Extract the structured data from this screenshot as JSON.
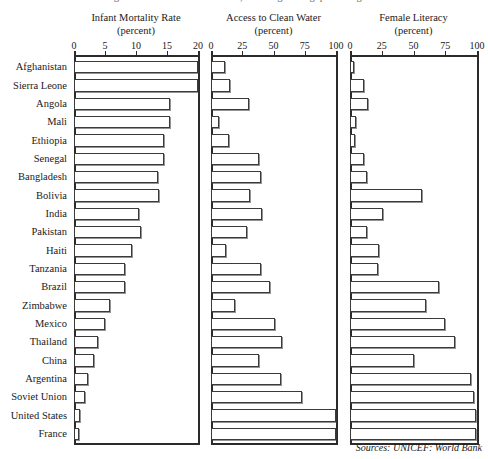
{
  "figure": {
    "top_cut_text": "a rough measure of social welfare, showing wide gaps among nations",
    "source_note": "Sources: UNICEF: World Bank"
  },
  "chart_data": {
    "type": "bar",
    "orientation": "horizontal",
    "title": "",
    "categories": [
      "Afghanistan",
      "Sierra Leone",
      "Angola",
      "Mali",
      "Ethiopia",
      "Senegal",
      "Bangladesh",
      "Bolivia",
      "India",
      "Pakistan",
      "Haiti",
      "Tanzania",
      "Brazil",
      "Zimbabwe",
      "Mexico",
      "Thailand",
      "China",
      "Argentina",
      "Soviet Union",
      "United States",
      "France"
    ],
    "panels": [
      {
        "title": "Infant Mortality Rate",
        "subtitle": "(percent)",
        "xlabel": "",
        "ylabel": "",
        "xlim": [
          0,
          20
        ],
        "ticks": [
          0,
          5,
          10,
          15,
          20
        ],
        "tick_labels": [
          "0",
          "5",
          "10",
          "15",
          "20"
        ],
        "values": [
          20.0,
          20.0,
          15.5,
          15.5,
          14.5,
          14.5,
          13.5,
          13.7,
          10.5,
          10.8,
          9.3,
          8.2,
          8.3,
          5.8,
          5.0,
          3.9,
          3.2,
          2.3,
          1.8,
          1.0,
          0.8
        ]
      },
      {
        "title": "Access to Clean Water",
        "subtitle": "(percent)",
        "xlabel": "",
        "ylabel": "",
        "xlim": [
          0,
          100
        ],
        "ticks": [
          0,
          25,
          50,
          75,
          100
        ],
        "tick_labels": [
          "0",
          "25",
          "50",
          "75",
          "100"
        ],
        "values": [
          11,
          15,
          30,
          6,
          14,
          38,
          40,
          31,
          41,
          29,
          12,
          40,
          47,
          19,
          51,
          57,
          38,
          56,
          73,
          100,
          100
        ]
      },
      {
        "title": "Female Literacy",
        "subtitle": "(percent)",
        "xlabel": "",
        "ylabel": "",
        "xlim": [
          0,
          100
        ],
        "ticks": [
          0,
          25,
          50,
          75,
          100
        ],
        "tick_labels": [
          "0",
          "25",
          "50",
          "75",
          "100"
        ],
        "values": [
          3,
          11,
          14,
          5,
          4,
          11,
          13,
          57,
          26,
          13,
          23,
          22,
          70,
          60,
          75,
          83,
          50,
          95,
          98,
          99,
          99
        ]
      }
    ],
    "grid": false,
    "legend": null
  },
  "style": {
    "bar_fill": "#ffffff",
    "bar_stroke": "#3a3a3a",
    "axis_color": "#2b2b2b",
    "text_color": "#1a1a1a",
    "background": "#ffffff"
  }
}
